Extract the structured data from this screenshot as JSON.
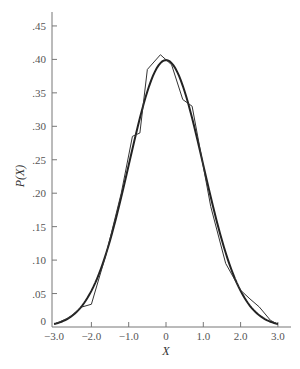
{
  "chart_data": {
    "type": "line",
    "title": "",
    "xlabel": "X",
    "ylabel": "P(X)",
    "xlim": [
      -3.0,
      3.0
    ],
    "ylim": [
      0,
      0.45
    ],
    "grid": false,
    "legend": null,
    "x_ticks": [
      "−3.0",
      "−2.0",
      "−1.0",
      "0",
      "1.0",
      "2.0",
      "3.0"
    ],
    "y_ticks": [
      "0",
      ".05",
      ".10",
      ".15",
      ".20",
      ".25",
      ".30",
      ".35",
      ".40",
      ".45"
    ],
    "series": [
      {
        "name": "Standard normal density",
        "style": "smooth",
        "x": [
          -3.0,
          -2.5,
          -2.0,
          -1.5,
          -1.0,
          -0.5,
          0.0,
          0.5,
          1.0,
          1.5,
          2.0,
          2.5,
          3.0
        ],
        "y": [
          0.004,
          0.018,
          0.054,
          0.13,
          0.242,
          0.352,
          0.399,
          0.352,
          0.242,
          0.13,
          0.054,
          0.018,
          0.004
        ]
      },
      {
        "name": "Empirical (frequency polygon)",
        "style": "polyline",
        "x": [
          -3.0,
          -2.6,
          -2.25,
          -2.0,
          -1.6,
          -1.2,
          -0.9,
          -0.7,
          -0.5,
          -0.15,
          0.15,
          0.45,
          0.7,
          0.9,
          1.2,
          1.6,
          2.0,
          2.25,
          2.5,
          2.8,
          3.0
        ],
        "y": [
          0.004,
          0.014,
          0.03,
          0.034,
          0.11,
          0.2,
          0.285,
          0.29,
          0.385,
          0.407,
          0.392,
          0.34,
          0.33,
          0.27,
          0.18,
          0.095,
          0.055,
          0.042,
          0.03,
          0.01,
          0.004
        ]
      }
    ]
  }
}
